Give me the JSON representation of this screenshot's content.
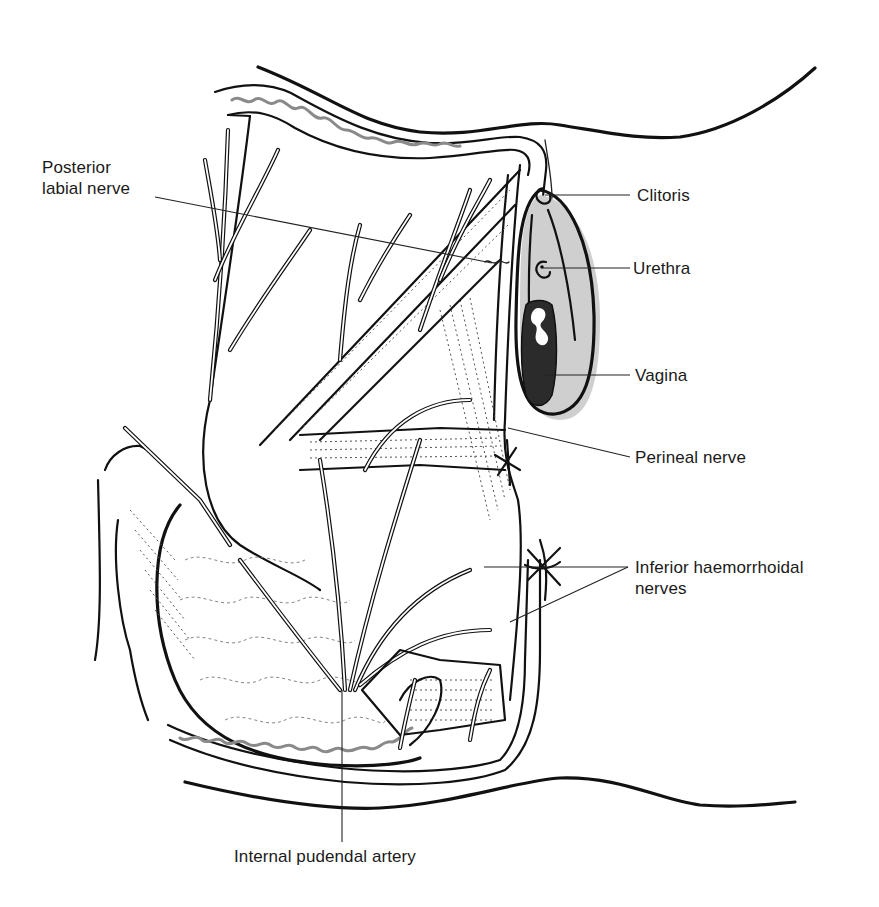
{
  "figure": {
    "labels": [
      {
        "id": "posterior-labial-nerve",
        "lines": [
          "Posterior",
          "labial nerve"
        ]
      },
      {
        "id": "clitoris",
        "lines": [
          "Clitoris"
        ]
      },
      {
        "id": "urethra",
        "lines": [
          "Urethra"
        ]
      },
      {
        "id": "vagina",
        "lines": [
          "Vagina"
        ]
      },
      {
        "id": "perineal-nerve",
        "lines": [
          "Perineal nerve"
        ]
      },
      {
        "id": "inferior-haemorrhoidal-nerves",
        "lines": [
          "Inferior haemorrhoidal",
          "nerves"
        ]
      },
      {
        "id": "internal-pudendal-artery",
        "lines": [
          "Internal pudendal artery"
        ]
      }
    ]
  },
  "colors": {
    "background": "#ffffff",
    "ink": "#111111",
    "shading": "#cfcfcf",
    "vagina_fill": "#2b2b2b",
    "label_text": "#1a1a1a"
  }
}
